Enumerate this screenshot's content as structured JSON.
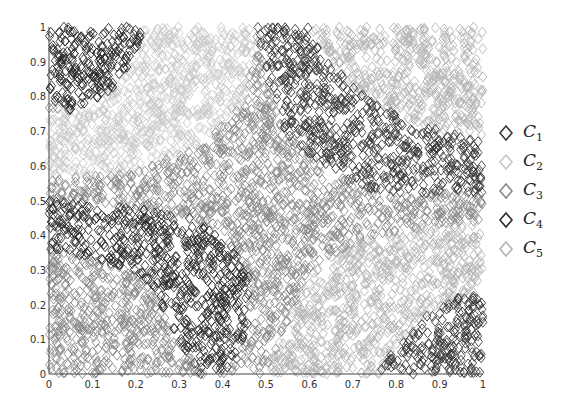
{
  "chart_data": {
    "type": "scatter",
    "title": "",
    "xlabel": "",
    "ylabel": "",
    "xlim": [
      0,
      1
    ],
    "ylim": [
      0,
      1
    ],
    "grid": false,
    "legend_position": "right",
    "x_ticks": [
      "0",
      "0.1",
      "0.2",
      "0.3",
      "0.4",
      "0.5",
      "0.6",
      "0.7",
      "0.8",
      "0.9",
      "1"
    ],
    "y_ticks": [
      "0",
      "0.1",
      "0.2",
      "0.3",
      "0.4",
      "0.5",
      "0.6",
      "0.7",
      "0.8",
      "0.9",
      "1"
    ],
    "marker": "diamond-open",
    "series": [
      {
        "name": "C1",
        "sub": "1",
        "color": "#3a3a3a",
        "description": "dark cluster, upper-right diagonal band and bottom-right corner"
      },
      {
        "name": "C2",
        "sub": "2",
        "color": "#c8c8c8",
        "description": "light cluster, upper-left / center-left region"
      },
      {
        "name": "C3",
        "sub": "3",
        "color": "#8a8a8a",
        "description": "medium cluster, central diagonal band and bottom-left"
      },
      {
        "name": "C4",
        "sub": "4",
        "color": "#2a2a2a",
        "description": "dark cluster, lower-left band and top-left corner"
      },
      {
        "name": "C5",
        "sub": "5",
        "color": "#b4b4b4",
        "description": "light cluster, lower-right region and top-right"
      }
    ],
    "regions": [
      {
        "series": 3,
        "polygon": [
          [
            0,
            1
          ],
          [
            0.22,
            1
          ],
          [
            0.19,
            0.9
          ],
          [
            0.16,
            0.83
          ],
          [
            0.06,
            0.76
          ],
          [
            0,
            0.77
          ]
        ]
      },
      {
        "series": 0,
        "polygon": [
          [
            0.48,
            1
          ],
          [
            0.6,
            1
          ],
          [
            0.66,
            0.88
          ],
          [
            0.74,
            0.79
          ],
          [
            0.85,
            0.72
          ],
          [
            1,
            0.67
          ],
          [
            1,
            0.52
          ],
          [
            0.92,
            0.53
          ],
          [
            0.8,
            0.51
          ],
          [
            0.7,
            0.55
          ],
          [
            0.6,
            0.63
          ],
          [
            0.54,
            0.7
          ],
          [
            0.5,
            0.86
          ]
        ]
      },
      {
        "series": 3,
        "polygon": [
          [
            0,
            0.5
          ],
          [
            0.12,
            0.49
          ],
          [
            0.24,
            0.47
          ],
          [
            0.33,
            0.45
          ],
          [
            0.42,
            0.37
          ],
          [
            0.46,
            0.28
          ],
          [
            0.46,
            0.14
          ],
          [
            0.42,
            0.02
          ],
          [
            0.35,
            0
          ],
          [
            0.3,
            0.1
          ],
          [
            0.25,
            0.22
          ],
          [
            0.2,
            0.3
          ],
          [
            0.1,
            0.33
          ],
          [
            0,
            0.36
          ]
        ]
      },
      {
        "series": 0,
        "polygon": [
          [
            0.76,
            0
          ],
          [
            1,
            0
          ],
          [
            1,
            0.24
          ],
          [
            0.94,
            0.22
          ],
          [
            0.86,
            0.16
          ],
          [
            0.8,
            0.08
          ]
        ]
      },
      {
        "series": 1,
        "polygon": [
          [
            0,
            0.76
          ],
          [
            0.06,
            0.76
          ],
          [
            0.16,
            0.83
          ],
          [
            0.22,
            1
          ],
          [
            0.48,
            1
          ],
          [
            0.45,
            0.78
          ],
          [
            0.35,
            0.66
          ],
          [
            0.2,
            0.58
          ],
          [
            0,
            0.56
          ]
        ]
      },
      {
        "series": 2,
        "polygon": [
          [
            0,
            0.56
          ],
          [
            0.2,
            0.58
          ],
          [
            0.35,
            0.66
          ],
          [
            0.45,
            0.78
          ],
          [
            0.5,
            0.86
          ],
          [
            0.54,
            0.7
          ],
          [
            0.6,
            0.63
          ],
          [
            0.7,
            0.55
          ],
          [
            0.8,
            0.51
          ],
          [
            0.92,
            0.53
          ],
          [
            1,
            0.52
          ],
          [
            1,
            0.44
          ],
          [
            0.85,
            0.42
          ],
          [
            0.7,
            0.38
          ],
          [
            0.6,
            0.3
          ],
          [
            0.55,
            0.15
          ],
          [
            0.5,
            0
          ],
          [
            0.42,
            0.02
          ],
          [
            0.46,
            0.14
          ],
          [
            0.46,
            0.28
          ],
          [
            0.42,
            0.37
          ],
          [
            0.33,
            0.45
          ],
          [
            0.24,
            0.47
          ],
          [
            0.12,
            0.49
          ],
          [
            0,
            0.5
          ]
        ]
      },
      {
        "series": 4,
        "polygon": [
          [
            0.5,
            0
          ],
          [
            0.76,
            0
          ],
          [
            0.8,
            0.08
          ],
          [
            0.86,
            0.16
          ],
          [
            0.94,
            0.22
          ],
          [
            1,
            0.24
          ],
          [
            1,
            0.44
          ],
          [
            0.85,
            0.42
          ],
          [
            0.7,
            0.38
          ],
          [
            0.6,
            0.3
          ],
          [
            0.55,
            0.15
          ]
        ]
      },
      {
        "series": 4,
        "polygon": [
          [
            0.6,
            1
          ],
          [
            1,
            1
          ],
          [
            1,
            0.67
          ],
          [
            0.85,
            0.72
          ],
          [
            0.74,
            0.79
          ],
          [
            0.66,
            0.88
          ]
        ]
      },
      {
        "series": 2,
        "polygon": [
          [
            0,
            0.36
          ],
          [
            0.1,
            0.33
          ],
          [
            0.2,
            0.3
          ],
          [
            0.25,
            0.22
          ],
          [
            0.3,
            0.1
          ],
          [
            0.35,
            0
          ],
          [
            0,
            0
          ]
        ]
      }
    ]
  },
  "legend": {
    "items": [
      {
        "label": "C",
        "sub": "1"
      },
      {
        "label": "C",
        "sub": "2"
      },
      {
        "label": "C",
        "sub": "3"
      },
      {
        "label": "C",
        "sub": "4"
      },
      {
        "label": "C",
        "sub": "5"
      }
    ]
  }
}
